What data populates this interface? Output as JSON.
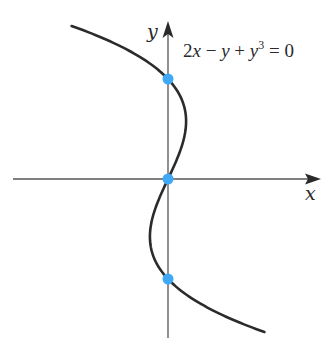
{
  "chart_data": {
    "type": "line",
    "title": "",
    "equation": "2x − y + y³ = 0",
    "equation_parts": {
      "a": "2",
      "x": "x",
      "minus": " − ",
      "y1": "y",
      "plus": " + ",
      "y2": "y",
      "exp": "3",
      "rhs": " = 0"
    },
    "xlabel": "x",
    "ylabel": "y",
    "grid": false,
    "legend": "none",
    "curve": {
      "description": "x = (y - y^3)/2",
      "y_range": [
        -1.53,
        1.53
      ],
      "color": "#2b2b2b"
    },
    "points": [
      {
        "x": 0,
        "y": 1,
        "color": "#3fa9f5"
      },
      {
        "x": 0,
        "y": 0,
        "color": "#3fa9f5"
      },
      {
        "x": 0,
        "y": -1,
        "color": "#3fa9f5"
      }
    ],
    "axes": {
      "color": "#555555",
      "arrow_color": "#2a2a2a"
    }
  }
}
